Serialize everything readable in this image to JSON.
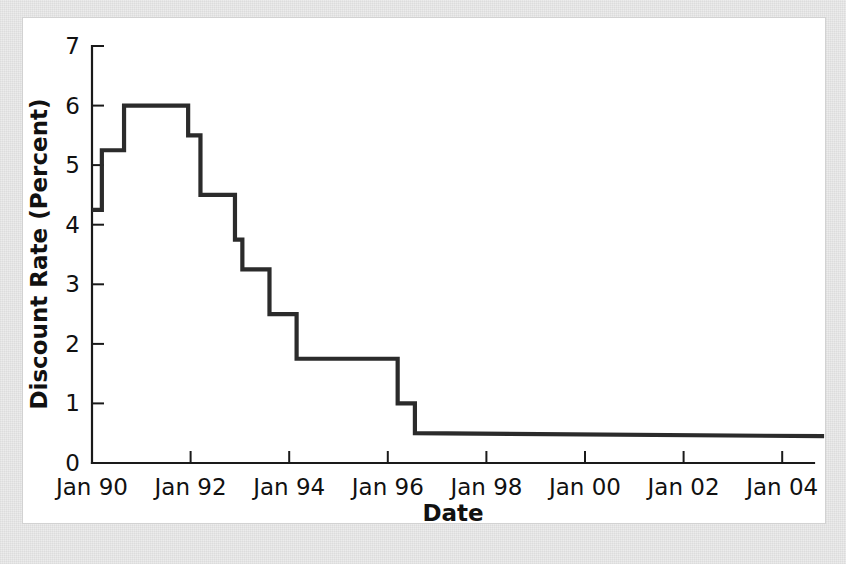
{
  "figure": {
    "background_color": "#ececec",
    "card_color": "#ffffff",
    "card_border_color": "#d2d2d2",
    "line_color": "#2b2b2b",
    "axis_color": "#1a1a1a"
  },
  "chart_data": {
    "type": "line",
    "subtype": "step",
    "title": "",
    "subtitle": "",
    "xlabel": "Date",
    "ylabel": "Discount Rate (Percent)",
    "xlim": [
      "Jan 90",
      "Jan 05"
    ],
    "ylim": [
      0,
      7
    ],
    "grid": false,
    "legend": null,
    "legend_position": "none",
    "y_ticks": [
      "0",
      "1",
      "2",
      "3",
      "4",
      "5",
      "6",
      "7"
    ],
    "y_tick_values": [
      0,
      1,
      2,
      3,
      4,
      5,
      6,
      7
    ],
    "x_ticks": [
      "Jan 90",
      "Jan 92",
      "Jan 94",
      "Jan 96",
      "Jan 98",
      "Jan 00",
      "Jan 02",
      "Jan 04"
    ],
    "x_tick_values": [
      1990.0,
      1992.0,
      1994.0,
      1996.0,
      1998.0,
      2000.0,
      2002.0,
      2004.0
    ],
    "series": [
      {
        "name": "Discount Rate",
        "color": "#2b2b2b",
        "x": [
          1990.0,
          1990.2,
          1990.2,
          1990.65,
          1990.65,
          1991.05,
          1991.05,
          1991.95,
          1991.95,
          1992.2,
          1992.2,
          1992.35,
          1992.35,
          1992.9,
          1992.9,
          1993.05,
          1993.05,
          1993.6,
          1993.6,
          1994.15,
          1994.15,
          1994.7,
          1994.7,
          1996.2,
          1996.2,
          1996.55,
          1996.55,
          2004.85
        ],
        "y": [
          4.25,
          4.25,
          5.25,
          5.25,
          6.0,
          6.0,
          6.0,
          6.0,
          5.5,
          5.5,
          4.5,
          4.5,
          4.5,
          4.5,
          3.75,
          3.75,
          3.25,
          3.25,
          2.5,
          2.5,
          1.75,
          1.75,
          1.75,
          1.75,
          1.0,
          1.0,
          0.5,
          0.45
        ]
      }
    ],
    "annotations": []
  }
}
